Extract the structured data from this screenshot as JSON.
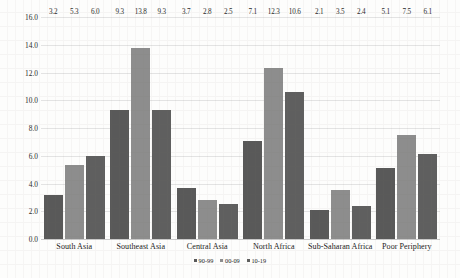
{
  "chart_data": {
    "type": "bar",
    "title": "",
    "xlabel": "",
    "ylabel": "",
    "ylim": [
      0,
      16
    ],
    "ytick_step": 2,
    "grid": true,
    "legend_position": "bottom",
    "categories": [
      "South Asia",
      "Southeast Asia",
      "Central Asia",
      "North Africa",
      "Sub-Saharan Africa",
      "Poor Periphery"
    ],
    "ytick_labels": [
      "0.0",
      "2.0",
      "4.0",
      "6.0",
      "8.0",
      "10.0",
      "12.0",
      "14.0",
      "16.0"
    ],
    "series": [
      {
        "name": "90-99",
        "color": "#595959",
        "values": [
          3.2,
          9.3,
          3.7,
          7.1,
          2.1,
          5.1
        ],
        "labels": [
          "3.2",
          "9.3",
          "3.7",
          "7.1",
          "2.1",
          "5.1"
        ]
      },
      {
        "name": "00-09",
        "color": "#8d8d8d",
        "values": [
          5.3,
          13.8,
          2.8,
          12.3,
          3.5,
          7.5
        ],
        "labels": [
          "5.3",
          "13.8",
          "2.8",
          "12.3",
          "3.5",
          "7.5"
        ]
      },
      {
        "name": "10-19",
        "color": "#5f5f5f",
        "values": [
          6.0,
          9.3,
          2.5,
          10.6,
          2.4,
          6.1
        ],
        "labels": [
          "6.0",
          "9.3",
          "2.5",
          "10.6",
          "2.4",
          "6.1"
        ]
      }
    ]
  }
}
